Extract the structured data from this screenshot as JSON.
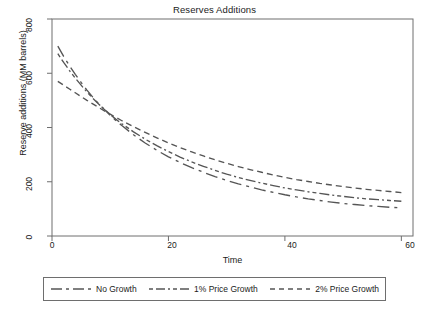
{
  "chart_data": {
    "type": "line",
    "title": "Reserves Additions",
    "xlabel": "Time",
    "ylabel": "Reserve additions (MM barrels)",
    "xlim": [
      0,
      62
    ],
    "ylim": [
      0,
      800
    ],
    "xticks": [
      "0",
      "20",
      "40",
      "60"
    ],
    "xtick_values": [
      0,
      20,
      40,
      60
    ],
    "yticks": [
      "0",
      "200",
      "400",
      "600",
      "800"
    ],
    "ytick_values": [
      0,
      200,
      400,
      600,
      800
    ],
    "grid": false,
    "legend_position": "below",
    "x": [
      1,
      2,
      3,
      4,
      5,
      6,
      7,
      8,
      9,
      10,
      11,
      12,
      14,
      16,
      18,
      20,
      22,
      24,
      26,
      28,
      30,
      32,
      34,
      36,
      38,
      40,
      42,
      44,
      46,
      48,
      50,
      52,
      54,
      56,
      58,
      60
    ],
    "series": [
      {
        "name": "No Growth",
        "dash": "long-dash",
        "color": "#555555",
        "values": [
          700,
          662,
          628,
          596,
          566,
          538,
          512,
          488,
          466,
          445,
          425,
          407,
          373,
          343,
          316,
          292,
          271,
          252,
          235,
          219,
          205,
          192,
          181,
          170,
          161,
          152,
          144,
          137,
          131,
          125,
          120,
          116,
          112,
          109,
          106,
          104
        ]
      },
      {
        "name": "1% Price Growth",
        "dash": "dash-dot",
        "color": "#555555",
        "values": [
          672,
          640,
          610,
          582,
          556,
          531,
          508,
          487,
          467,
          448,
          430,
          414,
          384,
          357,
          333,
          311,
          291,
          273,
          257,
          242,
          228,
          216,
          205,
          195,
          186,
          177,
          170,
          163,
          157,
          151,
          146,
          141,
          137,
          134,
          131,
          128
        ]
      },
      {
        "name": "2% Price Growth",
        "dash": "short-dash",
        "color": "#555555",
        "values": [
          570,
          556,
          542,
          528,
          514,
          500,
          487,
          474,
          461,
          449,
          437,
          425,
          403,
          382,
          362,
          343,
          326,
          310,
          295,
          281,
          268,
          256,
          245,
          235,
          225,
          216,
          208,
          201,
          194,
          188,
          182,
          177,
          172,
          168,
          164,
          160
        ]
      }
    ]
  },
  "legend": {
    "entries": [
      {
        "label": "No Growth"
      },
      {
        "label": "1% Price Growth"
      },
      {
        "label": "2% Price Growth"
      }
    ]
  },
  "colors": {
    "axis": "#6e6e6e",
    "line": "#555555",
    "text": "#1b1b1b",
    "background": "#ffffff"
  }
}
